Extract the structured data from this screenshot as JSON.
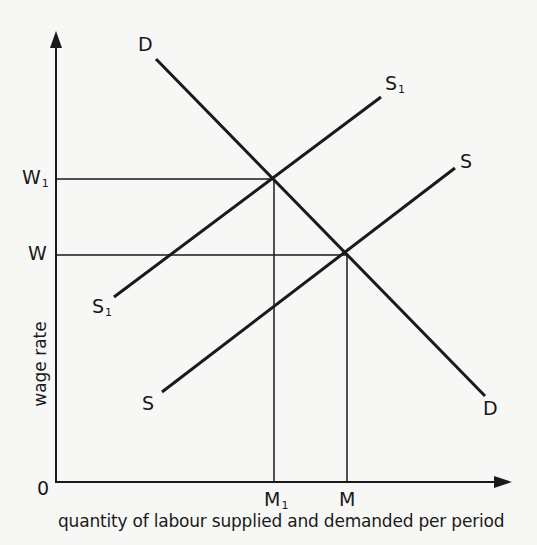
{
  "figure": {
    "x_axis_label": "quantity of labour supplied and demanded per period",
    "y_axis_label": "wage rate",
    "origin_label": "0",
    "wage_levels": [
      {
        "id": "w1",
        "label": "W",
        "subscript": "1",
        "y": 179
      },
      {
        "id": "w",
        "label": "W",
        "subscript": "",
        "y": 255
      }
    ],
    "quantity_levels": [
      {
        "id": "m1",
        "label": "M",
        "subscript": "1",
        "x": 274
      },
      {
        "id": "m",
        "label": "M",
        "subscript": "",
        "x": 347
      }
    ],
    "curves": [
      {
        "id": "demand",
        "name": "D",
        "start_label": "D",
        "end_label": "D",
        "x1": 156,
        "y1": 59,
        "x2": 485,
        "y2": 396
      },
      {
        "id": "supply-shifted",
        "name": "S1",
        "start_label": "S",
        "start_sub": "1",
        "end_label": "S",
        "end_sub": "1",
        "x1": 114,
        "y1": 297,
        "x2": 381,
        "y2": 97
      },
      {
        "id": "supply",
        "name": "S",
        "start_label": "S",
        "start_sub": "",
        "end_label": "S",
        "end_sub": "",
        "x1": 162,
        "y1": 392,
        "x2": 455,
        "y2": 168
      }
    ],
    "equilibria": [
      {
        "id": "eq-new",
        "wage": "W1",
        "quantity": "M1",
        "x": 274,
        "y": 179
      },
      {
        "id": "eq-original",
        "wage": "W",
        "quantity": "M",
        "x": 347,
        "y": 255
      }
    ],
    "colors": {
      "ink": "#1a1a1a",
      "paper": "#f7f7f5"
    }
  }
}
